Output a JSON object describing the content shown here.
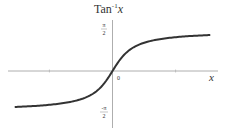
{
  "chart_data": {
    "type": "line",
    "title_base": "Tan",
    "title_sup": "-1",
    "title_var": "x",
    "xlabel": "x",
    "ylabel": "Tan⁻¹x",
    "origin_label": "0",
    "ytick_labels": [
      {
        "value": 1.5708,
        "num": "π",
        "den": "2"
      },
      {
        "value": -1.5708,
        "num": "-π",
        "den": "2"
      }
    ],
    "xlim": [
      -6.5,
      6.5
    ],
    "ylim": [
      -2.2,
      2.2
    ],
    "grid": false,
    "series": [
      {
        "name": "arctan(x)",
        "function": "atan",
        "x_range": [
          -6.2,
          6.2
        ],
        "color": "#333333"
      }
    ]
  }
}
